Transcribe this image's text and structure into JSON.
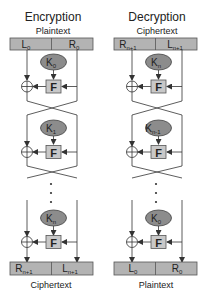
{
  "colors": {
    "box_fill": "#b3b3b3",
    "box_stroke": "#555555",
    "key_fill": "#8c8c8c",
    "f_fill": "#c8c8c8",
    "line": "#333333",
    "background": "#ffffff"
  },
  "encryption": {
    "title": "Encryption",
    "input_label": "Plaintext",
    "input_left": {
      "base": "L",
      "sub": "0"
    },
    "input_right": {
      "base": "R",
      "sub": "0"
    },
    "rounds": [
      {
        "key": {
          "base": "K",
          "sub": "0"
        },
        "function": "F"
      },
      {
        "key": {
          "base": "K",
          "sub": "1"
        },
        "function": "F"
      },
      {
        "key": {
          "base": "K",
          "sub": "n"
        },
        "function": "F"
      }
    ],
    "ellipsis": "⋮",
    "output_left": {
      "base": "R",
      "sub": "n+1"
    },
    "output_right": {
      "base": "L",
      "sub": "n+1"
    },
    "output_label": "Ciphertext"
  },
  "decryption": {
    "title": "Decryption",
    "input_label": "Ciphertext",
    "input_left": {
      "base": "R",
      "sub": "n+1"
    },
    "input_right": {
      "base": "L",
      "sub": "n+1"
    },
    "rounds": [
      {
        "key": {
          "base": "K",
          "sub": "n"
        },
        "function": "F"
      },
      {
        "key": {
          "base": "K",
          "sub": "n-1"
        },
        "function": "F"
      },
      {
        "key": {
          "base": "K",
          "sub": "0"
        },
        "function": "F"
      }
    ],
    "ellipsis": "⋮",
    "output_left": {
      "base": "L",
      "sub": "0"
    },
    "output_right": {
      "base": "R",
      "sub": "0"
    },
    "output_label": "Plaintext"
  }
}
